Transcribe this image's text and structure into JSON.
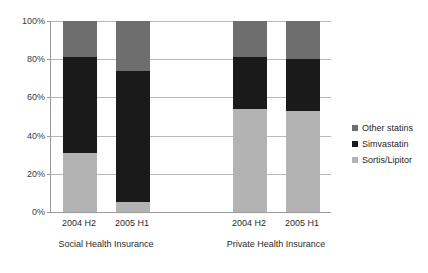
{
  "chart_data": {
    "type": "bar",
    "stacked": true,
    "stack_mode": "percent",
    "title": "",
    "subtitle": "",
    "xlabel": "",
    "ylabel": "",
    "ylim": [
      0,
      100
    ],
    "yticks": [
      0,
      20,
      40,
      60,
      80,
      100
    ],
    "ytick_labels": [
      "0%",
      "20%",
      "40%",
      "60%",
      "80%",
      "100%"
    ],
    "grid": true,
    "legend_position": "right",
    "categories": [
      "2004 H2",
      "2005 H1",
      "2004 H2",
      "2005 H1"
    ],
    "groups": [
      {
        "label": "Social Health Insurance",
        "categories": [
          "2004 H2",
          "2005 H1"
        ]
      },
      {
        "label": "Private Health Insurance",
        "categories": [
          "2004 H2",
          "2005 H1"
        ]
      }
    ],
    "series": [
      {
        "name": "Other statins",
        "color": "#6e6e6e",
        "values": [
          19,
          26,
          19,
          20
        ]
      },
      {
        "name": "Simvastatin",
        "color": "#1a1a1a",
        "values": [
          50,
          69,
          27,
          27
        ]
      },
      {
        "name": "Sortis/Lipitor",
        "color": "#b3b3b3",
        "values": [
          31,
          5,
          54,
          53
        ]
      }
    ],
    "bars": [
      {
        "group": "Social Health Insurance",
        "category": "2004 H2",
        "segments": [
          {
            "name": "Sortis/Lipitor",
            "value": 31,
            "color": "#b3b3b3"
          },
          {
            "name": "Simvastatin",
            "value": 50,
            "color": "#1a1a1a"
          },
          {
            "name": "Other statins",
            "value": 19,
            "color": "#6e6e6e"
          }
        ]
      },
      {
        "group": "Social Health Insurance",
        "category": "2005 H1",
        "segments": [
          {
            "name": "Sortis/Lipitor",
            "value": 5,
            "color": "#b3b3b3"
          },
          {
            "name": "Simvastatin",
            "value": 69,
            "color": "#1a1a1a"
          },
          {
            "name": "Other statins",
            "value": 26,
            "color": "#6e6e6e"
          }
        ]
      },
      {
        "group": "Private Health Insurance",
        "category": "2004 H2",
        "segments": [
          {
            "name": "Sortis/Lipitor",
            "value": 54,
            "color": "#b3b3b3"
          },
          {
            "name": "Simvastatin",
            "value": 27,
            "color": "#1a1a1a"
          },
          {
            "name": "Other statins",
            "value": 19,
            "color": "#6e6e6e"
          }
        ]
      },
      {
        "group": "Private Health Insurance",
        "category": "2005 H1",
        "segments": [
          {
            "name": "Sortis/Lipitor",
            "value": 53,
            "color": "#b3b3b3"
          },
          {
            "name": "Simvastatin",
            "value": 27,
            "color": "#1a1a1a"
          },
          {
            "name": "Other statins",
            "value": 20,
            "color": "#6e6e6e"
          }
        ]
      }
    ]
  },
  "axis": {
    "y_labels": [
      "100%",
      "80%",
      "60%",
      "40%",
      "20%",
      "0%"
    ]
  },
  "category_labels": [
    "2004 H2",
    "2005 H1",
    "2004 H2",
    "2005 H1"
  ],
  "group_labels": [
    "Social Health Insurance",
    "Private Health Insurance"
  ],
  "legend": {
    "items": [
      {
        "label": "Other statins",
        "color": "#6e6e6e"
      },
      {
        "label": "Simvastatin",
        "color": "#1a1a1a"
      },
      {
        "label": "Sortis/Lipitor",
        "color": "#b3b3b3"
      }
    ]
  },
  "colors": {
    "other_statins": "#6e6e6e",
    "simvastatin": "#1a1a1a",
    "sortis_lipitor": "#b3b3b3",
    "gridline": "#b8b8b8",
    "axis": "#9a9a9a",
    "background": "#ffffff",
    "text": "#2b2b2b"
  }
}
